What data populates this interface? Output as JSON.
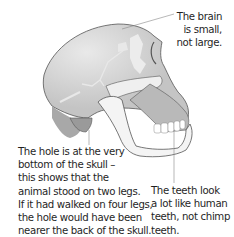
{
  "figure": {
    "colors": {
      "skull_fill": "#c9c9c9",
      "skull_dark": "#a8a8a8",
      "bone_light": "#ececec",
      "jaw_fill": "#f4f4f4",
      "outline": "#555555",
      "leader_line": "#888888"
    }
  },
  "annotations": {
    "brain": {
      "lines": [
        "The brain",
        "is small,",
        "not large."
      ]
    },
    "hole": {
      "lines": [
        "The hole is at the very",
        "bottom of the skull –",
        "this shows that the",
        "animal stood on two legs.",
        "If it had walked on four legs,",
        "the hole would have been",
        "nearer the back of the skull."
      ]
    },
    "teeth": {
      "lines": [
        "The teeth look",
        "a lot like human",
        "teeth, not chimp",
        "teeth."
      ]
    }
  }
}
